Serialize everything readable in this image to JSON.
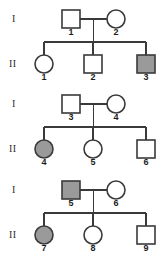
{
  "figure": {
    "kind": "pedigree-chart",
    "width": 165,
    "height": 260,
    "background_color": "#ffffff",
    "line_color": "#3a3a3a",
    "affected_fill_color": "#9a9a9a",
    "unaffected_fill_color": "#ffffff"
  },
  "legend_semantics": {
    "square": "male",
    "circle": "female",
    "filled": "affected",
    "open": "unaffected"
  },
  "families": [
    {
      "family_index": 1,
      "generation_label_parents": "I",
      "generation_label_children": "II",
      "parents": [
        {
          "id": "1",
          "label": "1",
          "shape": "square",
          "sex": "male",
          "status": "unaffected",
          "filled": false,
          "cx": 71,
          "cy": 19
        },
        {
          "id": "2",
          "label": "2",
          "shape": "circle",
          "sex": "female",
          "status": "unaffected",
          "filled": false,
          "cx": 116,
          "cy": 19
        }
      ],
      "children": [
        {
          "id": "1",
          "label": "1",
          "shape": "circle",
          "sex": "female",
          "status": "unaffected",
          "filled": false,
          "cx": 44,
          "cy": 64
        },
        {
          "id": "2",
          "label": "2",
          "shape": "square",
          "sex": "male",
          "status": "unaffected",
          "filled": false,
          "cx": 93,
          "cy": 64
        },
        {
          "id": "3",
          "label": "3",
          "shape": "square",
          "sex": "male",
          "status": "affected",
          "filled": true,
          "cx": 146,
          "cy": 64
        }
      ]
    },
    {
      "family_index": 2,
      "generation_label_parents": "I",
      "generation_label_children": "II",
      "parents": [
        {
          "id": "3",
          "label": "3",
          "shape": "square",
          "sex": "male",
          "status": "unaffected",
          "filled": false,
          "cx": 71,
          "cy": 104
        },
        {
          "id": "4",
          "label": "4",
          "shape": "circle",
          "sex": "female",
          "status": "unaffected",
          "filled": false,
          "cx": 116,
          "cy": 104
        }
      ],
      "children": [
        {
          "id": "4",
          "label": "4",
          "shape": "circle",
          "sex": "female",
          "status": "affected",
          "filled": true,
          "cx": 44,
          "cy": 149
        },
        {
          "id": "5",
          "label": "5",
          "shape": "circle",
          "sex": "female",
          "status": "unaffected",
          "filled": false,
          "cx": 93,
          "cy": 149
        },
        {
          "id": "6",
          "label": "6",
          "shape": "square",
          "sex": "male",
          "status": "unaffected",
          "filled": false,
          "cx": 146,
          "cy": 149
        }
      ]
    },
    {
      "family_index": 3,
      "generation_label_parents": "I",
      "generation_label_children": "II",
      "parents": [
        {
          "id": "5",
          "label": "5",
          "shape": "square",
          "sex": "male",
          "status": "affected",
          "filled": true,
          "cx": 71,
          "cy": 190
        },
        {
          "id": "6",
          "label": "6",
          "shape": "circle",
          "sex": "female",
          "status": "unaffected",
          "filled": false,
          "cx": 116,
          "cy": 190
        }
      ],
      "children": [
        {
          "id": "7",
          "label": "7",
          "shape": "circle",
          "sex": "female",
          "status": "affected",
          "filled": true,
          "cx": 44,
          "cy": 235
        },
        {
          "id": "8",
          "label": "8",
          "shape": "circle",
          "sex": "female",
          "status": "unaffected",
          "filled": false,
          "cx": 93,
          "cy": 235
        },
        {
          "id": "9",
          "label": "9",
          "shape": "square",
          "sex": "male",
          "status": "unaffected",
          "filled": false,
          "cx": 146,
          "cy": 235
        }
      ]
    }
  ],
  "generation_labels": [
    {
      "text": "I",
      "x": 12,
      "y": 22
    },
    {
      "text": "II",
      "x": 9,
      "y": 67
    },
    {
      "text": "I",
      "x": 12,
      "y": 107
    },
    {
      "text": "II",
      "x": 9,
      "y": 152
    },
    {
      "text": "I",
      "x": 12,
      "y": 193
    },
    {
      "text": "II",
      "x": 9,
      "y": 238
    }
  ]
}
